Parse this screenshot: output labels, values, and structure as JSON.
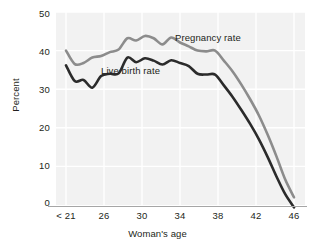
{
  "chart_data": {
    "type": "line",
    "title": "",
    "xlabel": "Woman's age",
    "ylabel": "Percent",
    "ylim": [
      0,
      50
    ],
    "yticks": [
      0,
      10,
      20,
      30,
      40,
      50
    ],
    "xticks": [
      "< 21",
      "26",
      "30",
      "34",
      "38",
      "42",
      "46"
    ],
    "grid": true,
    "legend_position": "inline-annotation",
    "x": [
      20,
      21,
      22,
      23,
      24,
      25,
      26,
      27,
      28,
      29,
      30,
      31,
      32,
      33,
      34,
      35,
      36,
      37,
      38,
      39,
      40,
      41,
      42,
      43,
      44,
      45,
      46
    ],
    "series": [
      {
        "name": "Pregnancy rate",
        "color": "#8c8c8c",
        "values": [
          40.0,
          36.5,
          36.8,
          38.2,
          38.6,
          39.6,
          40.3,
          43.2,
          42.6,
          43.8,
          43.2,
          41.6,
          43.4,
          42.1,
          41.1,
          40.0,
          39.8,
          40.0,
          37.4,
          34.6,
          31.2,
          27.4,
          23.2,
          18.2,
          12.6,
          6.6,
          2.0
        ]
      },
      {
        "name": "Live birth rate",
        "color": "#2b2b2b",
        "values": [
          36.2,
          32.1,
          32.4,
          30.4,
          33.4,
          34.0,
          34.1,
          38.2,
          37.0,
          38.0,
          37.4,
          36.4,
          37.5,
          36.8,
          36.0,
          34.0,
          33.8,
          33.8,
          31.0,
          28.0,
          24.6,
          21.0,
          17.0,
          12.4,
          7.4,
          2.8,
          -0.6
        ]
      }
    ],
    "annotations": [
      {
        "text": "Pregnancy rate",
        "x_px": 175,
        "y_px": 39
      },
      {
        "text": "Live birth rate",
        "x_px": 101,
        "y_px": 72
      }
    ]
  },
  "axes": {
    "y_ticks": [
      {
        "label": "50",
        "top": 8
      },
      {
        "label": "40",
        "top": 46
      },
      {
        "label": "30",
        "top": 84
      },
      {
        "label": "20",
        "top": 122
      },
      {
        "label": "10",
        "top": 160
      },
      {
        "label": "0",
        "top": 197
      }
    ],
    "x_ticks": [
      {
        "label": "< 21",
        "left": 46
      },
      {
        "label": "26",
        "left": 84
      },
      {
        "label": "30",
        "left": 122
      },
      {
        "label": "34",
        "left": 160
      },
      {
        "label": "38",
        "left": 198
      },
      {
        "label": "42",
        "left": 236
      },
      {
        "label": "46",
        "left": 274
      }
    ],
    "x_title": "Woman's age",
    "y_title": "Percent"
  },
  "style": {
    "plot_bg": "#f2f2f2",
    "grid_color": "#ffffff",
    "axis_color": "#a6a6a6",
    "text_color": "#231f20",
    "pregnancy_color": "#8c8c8c",
    "live_birth_color": "#2b2b2b"
  }
}
